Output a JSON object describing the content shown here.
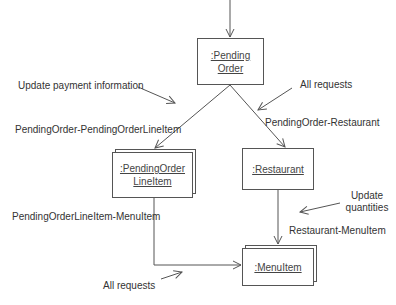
{
  "objects": {
    "pending_order": {
      "line1": ":Pending",
      "line2": "Order"
    },
    "pending_order_line_item": {
      "line1": ":PendingOrder",
      "line2": "LineItem"
    },
    "restaurant": {
      "label": ":Restaurant"
    },
    "menu_item": {
      "label": ":MenuItem"
    }
  },
  "links": {
    "po_poli": "PendingOrder-PendingOrderLineItem",
    "po_restaurant": "PendingOrder-Restaurant",
    "poli_menuitem": "PendingOrderLineItem-MenuItem",
    "restaurant_menuitem": "Restaurant-MenuItem"
  },
  "messages": {
    "update_payment": "Update payment information",
    "all_requests_top": "All requests",
    "update_quantities_1": "Update",
    "update_quantities_2": "quantities",
    "all_requests_bottom": "All requests"
  },
  "colors": {
    "line": "#555555",
    "text": "#333333",
    "background": "#ffffff"
  }
}
